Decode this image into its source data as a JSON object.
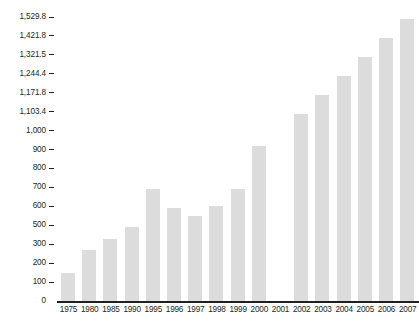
{
  "chart_data": {
    "type": "bar",
    "title": "",
    "subtitle": "",
    "xlabel": "",
    "ylabel": "",
    "categories": [
      "1975",
      "1980",
      "1985",
      "1990",
      "1995",
      "1996",
      "1997",
      "1998",
      "1999",
      "2000",
      "2001",
      "2002",
      "2003",
      "2004",
      "2005",
      "2006",
      "2007"
    ],
    "values": [
      160,
      280,
      375,
      500,
      700,
      600,
      560,
      610,
      700,
      930,
      0,
      1103.4,
      1171.8,
      1244.4,
      1321.5,
      1421.8,
      1529.8
    ],
    "series": [
      {
        "name": "series-1",
        "values": [
          160,
          280,
          375,
          500,
          700,
          600,
          560,
          610,
          700,
          930,
          0,
          1103.4,
          1171.8,
          1244.4,
          1321.5,
          1421.8,
          1529.8
        ]
      }
    ],
    "ytick_labels": [
      "1,529.8",
      "1,421.8",
      "1,321.5",
      "1,244.4",
      "1,171.8",
      "1,103.4",
      "1,000",
      "900",
      "800",
      "700",
      "600",
      "500",
      "300",
      "200",
      "100",
      "0"
    ],
    "ytick_values": [
      1529.8,
      1421.8,
      1321.5,
      1244.4,
      1171.8,
      1103.4,
      1000,
      900,
      800,
      700,
      600,
      500,
      300,
      200,
      100,
      0
    ],
    "ylim": [
      0,
      1529.8
    ],
    "grid": false,
    "legend": false,
    "legend_position": "none",
    "bar_color": "#dcdcdc",
    "axis_color": "#231f20",
    "text_color": "#231f20",
    "background_color": "#ffffff"
  }
}
